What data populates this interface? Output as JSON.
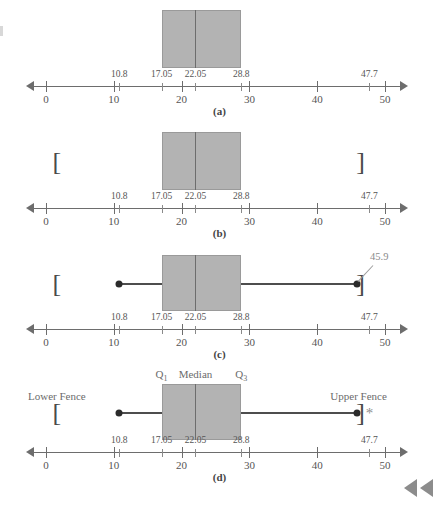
{
  "figure": {
    "axis": {
      "min": 0,
      "max": 50,
      "major_ticks": [
        0,
        10,
        20,
        30,
        40,
        50
      ],
      "major_tick_labels": [
        "0",
        "10",
        "20",
        "30",
        "40",
        "50"
      ],
      "minor_ticks": [
        10.8,
        17.05,
        22.05,
        28.8,
        47.7
      ],
      "minor_tick_labels": [
        "10.8",
        "17.05",
        "22.05",
        "28.8",
        "47.7"
      ]
    },
    "five_number_summary": {
      "min_label": "10.8",
      "q1_label": "17.05",
      "median_label": "22.05",
      "q3_label": "28.8",
      "max_label": "47.7",
      "min": 10.8,
      "q1": 17.05,
      "median": 22.05,
      "q3": 28.8,
      "max": 47.7
    },
    "fences": {
      "lower": 1.6,
      "upper": 46.4,
      "lower_label": "Lower Fence",
      "upper_label": "Upper Fence",
      "lower_bracket": "[",
      "upper_bracket": "]"
    },
    "whiskers": {
      "left_end": 10.8,
      "right_end": 45.9,
      "right_annotation": "45.9"
    },
    "outlier": {
      "value": 47.7,
      "symbol": "*"
    },
    "quartile_labels": {
      "q1": "Q",
      "q1_sub": "1",
      "median": "Median",
      "q3": "Q",
      "q3_sub": "3"
    },
    "panels": [
      {
        "id": "a",
        "letter": "(a)",
        "caption": "(a)"
      },
      {
        "id": "b",
        "letter": "(b)",
        "caption": "(b)"
      },
      {
        "id": "c",
        "letter": "(c)",
        "caption": "(c)"
      },
      {
        "id": "d",
        "letter": "(d)",
        "caption": "(d)"
      }
    ],
    "nav": {
      "prev_label": "previous",
      "prev_label_2": "previous-fast"
    },
    "colors": {
      "box_fill": "#b3b3b3",
      "box_border": "#9a9a9a",
      "axis": "#6d6d6d",
      "text": "#555555",
      "annotation": "#8a8a8a",
      "nav": "#8c8c8c"
    }
  },
  "chart_data": {
    "type": "boxplot",
    "xlabel": "",
    "ylabel": "",
    "xlim": [
      0,
      50
    ],
    "grid": false,
    "legend": "none",
    "five_number_summary": {
      "minimum": 10.8,
      "q1": 17.05,
      "median": 22.05,
      "q3": 28.8,
      "maximum": 47.7
    },
    "iqr": 11.75,
    "lower_fence": 1.6,
    "upper_fence": 46.4,
    "whisker_low": 10.8,
    "whisker_high": 45.9,
    "outliers": [
      47.7
    ],
    "tick_labels_major": [
      "0",
      "10",
      "20",
      "30",
      "40",
      "50"
    ],
    "tick_labels_minor": [
      "10.8",
      "17.05",
      "22.05",
      "28.8",
      "47.7"
    ],
    "annotations": [
      "45.9",
      "Lower Fence",
      "Upper Fence",
      "Q1",
      "Median",
      "Q3"
    ],
    "panels": [
      "(a)",
      "(b)",
      "(c)",
      "(d)"
    ]
  }
}
